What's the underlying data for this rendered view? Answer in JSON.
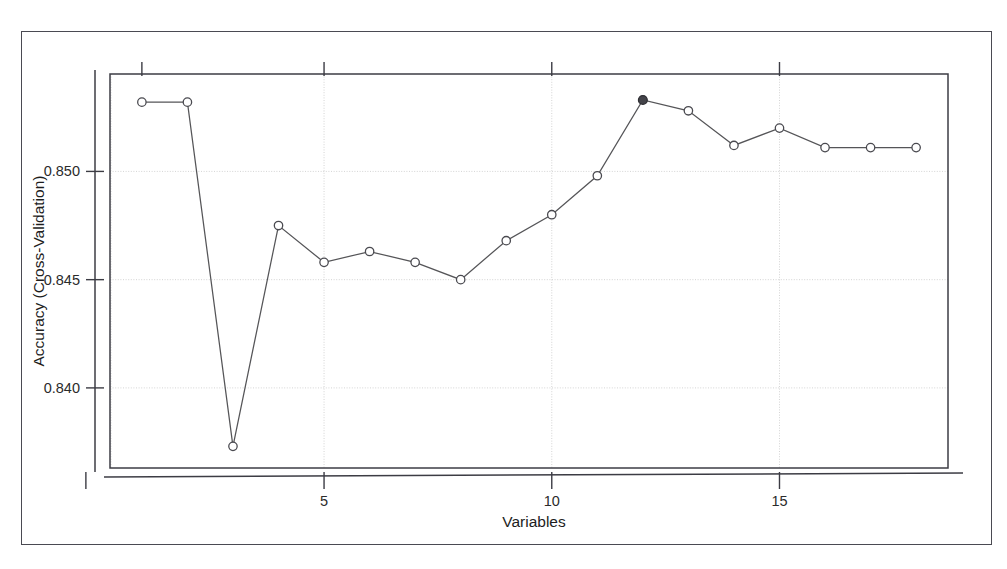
{
  "figure": {
    "kind": "r-caret-rfe-plot",
    "background_color": "#ffffff",
    "frame_color": "#4a4a52",
    "line_color": "#555558",
    "point_stroke_color": "#4a4a50",
    "point_fill_color": "#ffffff",
    "selected_point_fill_color": "#44444a",
    "grid_color": "#cfcfcf"
  },
  "chart_data": {
    "type": "line",
    "title": "",
    "xlabel": "Variables",
    "ylabel": "Accuracy (Cross-Validation)",
    "x": [
      1,
      2,
      3,
      4,
      5,
      6,
      7,
      8,
      9,
      10,
      11,
      12,
      13,
      14,
      15,
      16,
      17,
      18
    ],
    "values": [
      0.8532,
      0.8532,
      0.8373,
      0.8475,
      0.8458,
      0.8463,
      0.8458,
      0.845,
      0.8468,
      0.848,
      0.8498,
      0.8533,
      0.8528,
      0.8512,
      0.852,
      0.8511,
      0.8511,
      0.8511
    ],
    "xlim": [
      0.3,
      18.7
    ],
    "ylim": [
      0.8363,
      0.8545
    ],
    "xticks": [
      5,
      10,
      15
    ],
    "xtick_labels": [
      "5",
      "10",
      "15"
    ],
    "yticks": [
      0.84,
      0.845,
      0.85
    ],
    "ytick_labels": [
      "0.840",
      "0.845",
      "0.850"
    ],
    "grid": true,
    "legend": "none",
    "marker": "open-circle",
    "selected_index": 12,
    "selected_label": "12",
    "series": [
      {
        "name": "Accuracy (Cross-Validation)",
        "values": [
          0.8532,
          0.8532,
          0.8373,
          0.8475,
          0.8458,
          0.8463,
          0.8458,
          0.845,
          0.8468,
          0.848,
          0.8498,
          0.8533,
          0.8528,
          0.8512,
          0.852,
          0.8511,
          0.8511,
          0.8511
        ]
      }
    ]
  }
}
